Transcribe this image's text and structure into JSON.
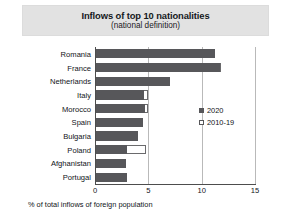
{
  "chart_data": {
    "type": "bar",
    "orientation": "horizontal",
    "title": "Inflows of top 10 nationalities",
    "subtitle": "(national definition)",
    "xlabel": "% of total inflows of foreign population",
    "ylabel": "",
    "xlim": [
      0,
      15
    ],
    "xticks": [
      0,
      5,
      10,
      15
    ],
    "xtick_labels": [
      "0",
      "5",
      "10",
      "15"
    ],
    "grid": true,
    "legend_position": "right",
    "categories": [
      "Romania",
      "France",
      "Netherlands",
      "Italy",
      "Morocco",
      "Spain",
      "Bulgaria",
      "Poland",
      "Afghanistan",
      "Portugal"
    ],
    "series": [
      {
        "name": "2020",
        "color": "#57575a",
        "values": [
          11.2,
          11.6,
          6.9,
          4.5,
          4.6,
          4.4,
          3.9,
          2.9,
          2.8,
          2.9
        ]
      },
      {
        "name": "2010-19",
        "color": "#ffffff",
        "values": [
          10.6,
          11.7,
          0.0,
          4.9,
          4.9,
          0.0,
          0.0,
          4.7,
          0.0,
          0.0
        ]
      }
    ]
  },
  "legend": {
    "items": [
      {
        "label": "2020",
        "swatch": "filled"
      },
      {
        "label": "2010-19",
        "swatch": "open"
      }
    ]
  }
}
